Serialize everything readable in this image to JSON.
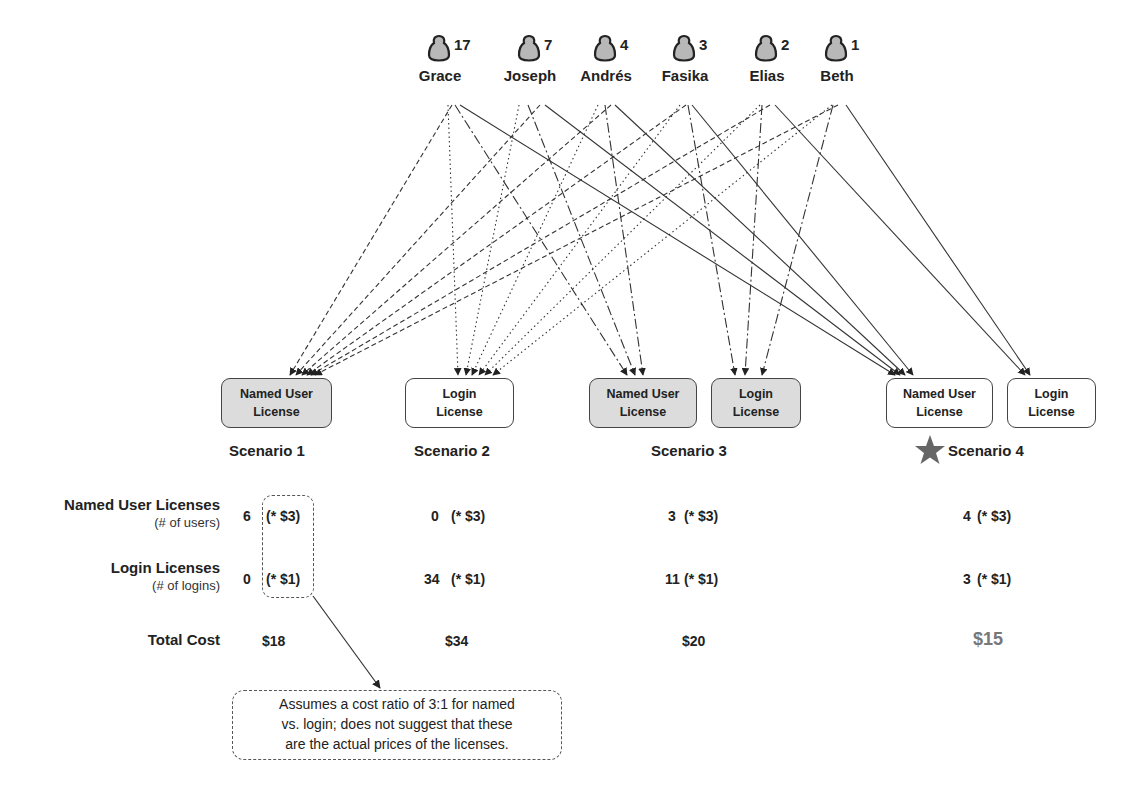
{
  "users": [
    {
      "name": "Grace",
      "logins": 17,
      "x": 440
    },
    {
      "name": "Joseph",
      "logins": 7,
      "x": 530
    },
    {
      "name": "Andrés",
      "logins": 4,
      "x": 606
    },
    {
      "name": "Fasika",
      "logins": 3,
      "x": 685
    },
    {
      "name": "Elias",
      "logins": 2,
      "x": 767
    },
    {
      "name": "Beth",
      "logins": 1,
      "x": 837
    }
  ],
  "boxes": {
    "s1_named": {
      "line1": "Named User",
      "line2": "License",
      "shaded": true
    },
    "s2_login": {
      "line1": "Login",
      "line2": "License",
      "shaded": false
    },
    "s3_named": {
      "line1": "Named User",
      "line2": "License",
      "shaded": true
    },
    "s3_login": {
      "line1": "Login",
      "line2": "License",
      "shaded": true
    },
    "s4_named": {
      "line1": "Named User",
      "line2": "License",
      "shaded": false
    },
    "s4_login": {
      "line1": "Login",
      "line2": "License",
      "shaded": false
    }
  },
  "scenarios": [
    {
      "label": "Scenario 1",
      "named_count": "6",
      "login_count": "0",
      "named_rate": "(* $3)",
      "login_rate": "(* $1)",
      "total": "$18",
      "best": false
    },
    {
      "label": "Scenario 2",
      "named_count": "0",
      "login_count": "34",
      "named_rate": "(* $3)",
      "login_rate": "(* $1)",
      "total": "$34",
      "best": false
    },
    {
      "label": "Scenario 3",
      "named_count": "3",
      "login_count": "11",
      "named_rate": "(* $3)",
      "login_rate": "(* $1)",
      "total": "$20",
      "best": false
    },
    {
      "label": "Scenario 4",
      "named_count": "4",
      "login_count": "3",
      "named_rate": "(* $3)",
      "login_rate": "(* $1)",
      "total": "$15",
      "best": true
    }
  ],
  "row_labels": {
    "named": {
      "main": "Named User Licenses",
      "sub": "(# of users)"
    },
    "login": {
      "main": "Login Licenses",
      "sub": "(# of logins)"
    },
    "total": {
      "main": "Total Cost"
    }
  },
  "callout": {
    "line1": "Assumes a cost ratio of 3:1 for named",
    "line2": "vs. login; does not suggest that these",
    "line3": "are the actual prices of the licenses."
  },
  "icons": {
    "user": "person-silhouette-icon",
    "best_marker": "star-icon"
  },
  "colors": {
    "line": "#333333",
    "shaded_box": "#dcdcdc",
    "best_total": "#777777",
    "star": "#666666"
  },
  "assignments": {
    "scenario_1": {
      "Grace": "named",
      "Joseph": "named",
      "Andrés": "named",
      "Fasika": "named",
      "Elias": "named",
      "Beth": "named"
    },
    "scenario_2": {
      "Grace": "login",
      "Joseph": "login",
      "Andrés": "login",
      "Fasika": "login",
      "Elias": "login",
      "Beth": "login"
    },
    "scenario_3": {
      "Grace": "named",
      "Joseph": "named",
      "Andrés": "named",
      "Fasika": "login",
      "Elias": "login",
      "Beth": "login"
    },
    "scenario_4": {
      "Grace": "named",
      "Joseph": "named",
      "Andrés": "named",
      "Fasika": "named",
      "Elias": "login",
      "Beth": "login"
    }
  }
}
